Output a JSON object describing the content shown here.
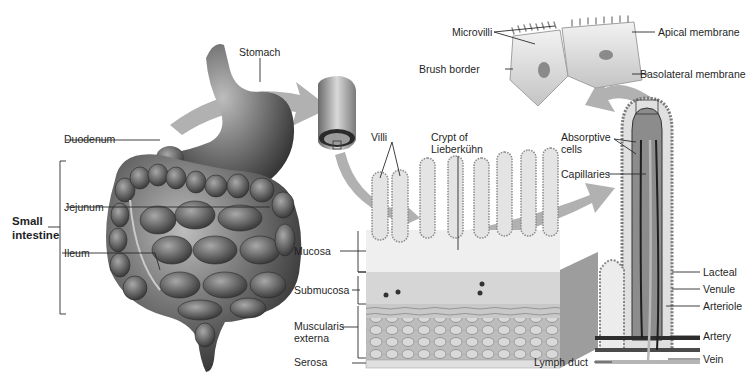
{
  "diagram": {
    "colors": {
      "organ_fill": "#7a7a7a",
      "organ_dark": "#3a3a3a",
      "tissue_light": "#e6e6e6",
      "arrow": "#a8a8a8",
      "label_line": "#2b2b2b",
      "background": "#ffffff"
    },
    "labels": {
      "stomach": "Stomach",
      "duodenum": "Duodenum",
      "jejunum": "Jejunum",
      "ileum": "Ileum",
      "small_intestine_1": "Small",
      "small_intestine_2": "intestine",
      "villi": "Villi",
      "crypt_1": "Crypt of",
      "crypt_2": "Lieberkühn",
      "mucosa": "Mucosa",
      "submucosa": "Submucosa",
      "muscularis_1": "Muscularis",
      "muscularis_2": "externa",
      "serosa": "Serosa",
      "microvilli": "Microvilli",
      "apical_membrane": "Apical membrane",
      "brush_border": "Brush border",
      "basolateral_membrane": "Basolateral membrane",
      "absorptive_1": "Absorptive",
      "absorptive_2": "cells",
      "capillaries": "Capillaries",
      "lacteal": "Lacteal",
      "venule": "Venule",
      "arteriole": "Arteriole",
      "artery": "Artery",
      "vein": "Vein",
      "lymph_duct": "Lymph duct"
    }
  }
}
